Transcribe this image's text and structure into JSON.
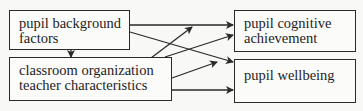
{
  "diagram": {
    "nodes": [
      {
        "id": "background",
        "lines": [
          "pupil background",
          "factors"
        ]
      },
      {
        "id": "classroom",
        "lines": [
          "classroom organization",
          "teacher characteristics"
        ]
      },
      {
        "id": "cognitive",
        "lines": [
          "pupil cognitive",
          "achievement"
        ]
      },
      {
        "id": "wellbeing",
        "lines": [
          "pupil wellbeing"
        ]
      }
    ],
    "edges": [
      {
        "from": "background",
        "to": "classroom"
      },
      {
        "from": "background",
        "to": "cognitive"
      },
      {
        "from": "background",
        "to": "wellbeing"
      },
      {
        "from": "classroom",
        "to": "cognitive"
      },
      {
        "from": "classroom",
        "to": "wellbeing"
      }
    ],
    "colors": {
      "line": "#2a2a2a",
      "background": "#f8f8f6"
    }
  }
}
